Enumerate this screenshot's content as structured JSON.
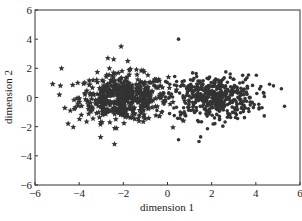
{
  "chart_data": {
    "type": "scatter",
    "title": "",
    "xlabel": "dimension 1",
    "ylabel": "dimension 2",
    "xlim": [
      -6,
      6
    ],
    "ylim": [
      -6,
      6
    ],
    "xticks": [
      "-6",
      "-4",
      "-2",
      "0",
      "2",
      "4",
      "6"
    ],
    "yticks": [
      "-6",
      "-4",
      "-2",
      "0",
      "2",
      "4",
      "6"
    ],
    "grid": false,
    "legend": null,
    "series": [
      {
        "name": "cluster A",
        "marker": "star",
        "color": "#333333",
        "center": [
          -2.0,
          0.0
        ],
        "spread": [
          1.0,
          0.8
        ],
        "count": 500,
        "outliers": [
          [
            -4.8,
            2.0
          ],
          [
            -2.1,
            3.5
          ],
          [
            -2.7,
            2.7
          ],
          [
            -1.8,
            2.5
          ],
          [
            -4.5,
            -1.8
          ],
          [
            -2.4,
            -3.2
          ],
          [
            -4.4,
            -0.9
          ]
        ]
      },
      {
        "name": "cluster B",
        "marker": "dot",
        "color": "#333333",
        "center": [
          2.0,
          0.0
        ],
        "spread": [
          1.0,
          0.75
        ],
        "count": 500,
        "outliers": [
          [
            0.5,
            4.0
          ],
          [
            5.3,
            -0.6
          ],
          [
            4.8,
            0.8
          ],
          [
            0.5,
            -2.9
          ],
          [
            1.5,
            -2.7
          ]
        ]
      }
    ]
  }
}
